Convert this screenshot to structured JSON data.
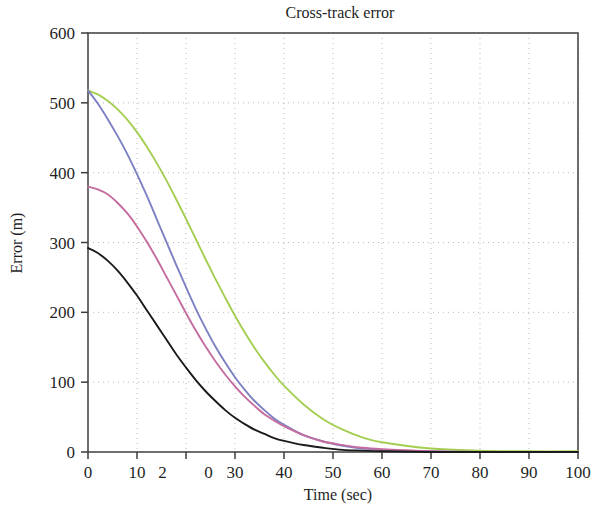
{
  "chart_data": {
    "type": "line",
    "title": "Cross-track error",
    "xlabel": "Time (sec)",
    "ylabel": "Error (m)",
    "xlim": [
      0,
      100
    ],
    "ylim": [
      0,
      600
    ],
    "grid": true,
    "legend": "none",
    "xticks": [
      0,
      10,
      20,
      30,
      40,
      50,
      60,
      70,
      80,
      90,
      100
    ],
    "xtick_labels": [
      "0",
      "10",
      "2",
      "0",
      "30",
      "40",
      "50",
      "60",
      "70",
      "80",
      "90",
      "100"
    ],
    "yticks": [
      0,
      100,
      200,
      300,
      400,
      500,
      600
    ],
    "ytick_labels": [
      "0",
      "100",
      "200",
      "300",
      "400",
      "500",
      "600"
    ],
    "x": [
      0,
      2,
      4,
      6,
      8,
      10,
      12,
      14,
      16,
      18,
      20,
      22,
      24,
      26,
      28,
      30,
      32,
      34,
      36,
      38,
      40,
      44,
      48,
      52,
      56,
      60,
      70,
      80,
      90,
      100
    ],
    "series": [
      {
        "name": "series-green",
        "color": "#a4ce52",
        "values": [
          518,
          512,
          503,
          491,
          476,
          458,
          437,
          414,
          389,
          362,
          334,
          305,
          276,
          248,
          221,
          195,
          171,
          149,
          129,
          111,
          95,
          68,
          47,
          32,
          21,
          14,
          5,
          2,
          1,
          1
        ]
      },
      {
        "name": "series-blue",
        "color": "#7d80c2",
        "values": [
          518,
          499,
          477,
          453,
          427,
          398,
          367,
          334,
          301,
          268,
          236,
          205,
          177,
          151,
          128,
          107,
          89,
          73,
          60,
          48,
          39,
          24,
          15,
          9,
          5,
          3,
          1,
          0,
          0,
          0
        ]
      },
      {
        "name": "series-magenta",
        "color": "#c46c9f",
        "values": [
          380,
          376,
          369,
          357,
          342,
          323,
          301,
          277,
          251,
          225,
          199,
          174,
          151,
          130,
          111,
          94,
          79,
          66,
          54,
          45,
          37,
          24,
          15,
          10,
          6,
          4,
          1,
          0,
          0,
          0
        ]
      },
      {
        "name": "series-black",
        "color": "#1b1b1b",
        "values": [
          292,
          285,
          274,
          260,
          243,
          224,
          203,
          182,
          161,
          140,
          121,
          103,
          87,
          73,
          60,
          49,
          40,
          32,
          26,
          20,
          16,
          10,
          6,
          3,
          2,
          1,
          0,
          0,
          0,
          0
        ]
      }
    ]
  },
  "figure": {
    "title": "Cross-track error",
    "x_axis_title": "Time (sec)",
    "y_axis_title": "Error (m)"
  }
}
